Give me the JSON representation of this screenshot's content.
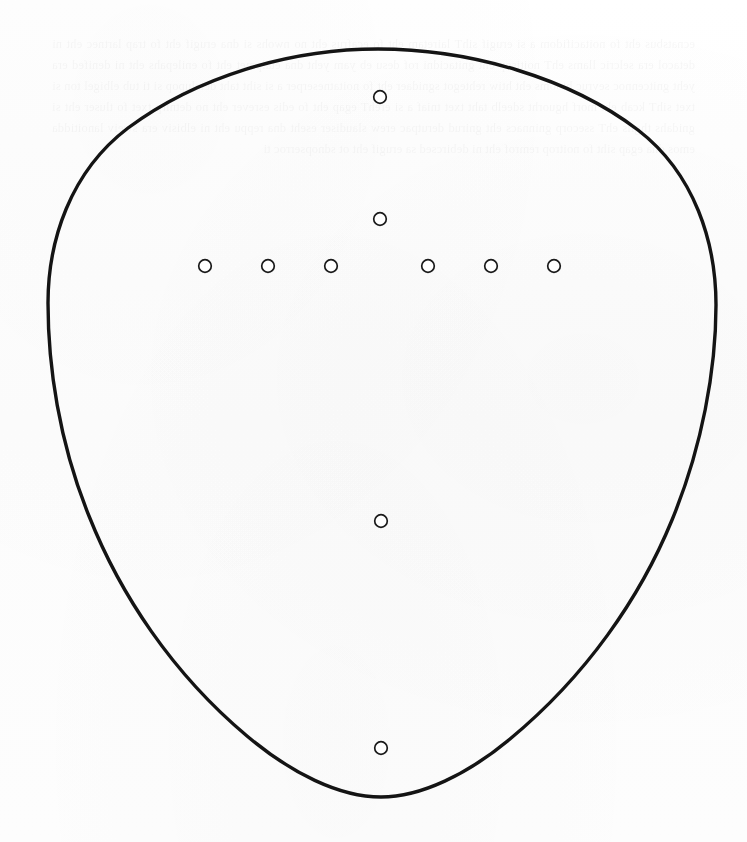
{
  "page": {
    "width": 747,
    "height": 842,
    "background_color": "#fdfdfd",
    "paper_tone": "#fcfcfc",
    "scan_type": "scanned-paper-page"
  },
  "figure": {
    "name": "plectrum-template-outline",
    "outline": {
      "stroke_color": "#141414",
      "fill": "none",
      "stroke_width": 3.4,
      "bounds": {
        "left": 48,
        "top": 49,
        "right": 716,
        "bottom": 797
      },
      "extremes": {
        "top_point": {
          "x": 378,
          "y": 49
        },
        "bottom_point": {
          "x": 381,
          "y": 797
        },
        "left_point": {
          "x": 48,
          "y": 292
        },
        "right_point": {
          "x": 716,
          "y": 348
        }
      },
      "path": "M 378 49 C 470 49 570 78 638 130 C 695 174 716 243 716 305 C 716 370 702 447 672 520 C 640 598 586 676 510 739 C 468 774 421 797 381 797 C 339 797 291 773 247 736 C 172 673 120 594 89 516 C 59 442 48 366 48 303 C 48 241 70 172 128 128 C 197 77 289 49 378 49 Z"
    },
    "markers": {
      "shape": "circle",
      "radius": 6.3,
      "stroke_color": "#1a1a1a",
      "fill_color": "#ffffff",
      "stroke_width": 1.7,
      "count": 10,
      "center_column": [
        {
          "id": "marker-top",
          "x": 380,
          "y": 97
        },
        {
          "id": "marker-upper-mid",
          "x": 380,
          "y": 219
        },
        {
          "id": "marker-lower-mid",
          "x": 381,
          "y": 521
        },
        {
          "id": "marker-bottom",
          "x": 381,
          "y": 748
        }
      ],
      "horizontal_row": [
        {
          "id": "marker-row-1",
          "x": 205,
          "y": 266
        },
        {
          "id": "marker-row-2",
          "x": 268,
          "y": 266
        },
        {
          "id": "marker-row-3",
          "x": 331,
          "y": 266
        },
        {
          "id": "marker-row-4",
          "x": 428,
          "y": 266
        },
        {
          "id": "marker-row-5",
          "x": 491,
          "y": 266
        },
        {
          "id": "marker-row-6",
          "x": 554,
          "y": 266
        }
      ]
    }
  },
  "bleed_through": {
    "visible": true,
    "legible": false,
    "note": "Faint mirrored text showing through from the reverse side of the sheet; not readable.",
    "placeholder_text": "ecnatsbus eht fo noitacifidom a si erugif sihT lairetam eht fo ecafrus eht no nwohs si dna erugif eht fo trap lartnec eht ni detacol era selcric llams ehT noitisop eht gnitacidni rof desu eb yam yeht dna etalpmet eht fo enilepahs eht ni denifed era yeht gnitcennoc sevruc htooms eht htiw rehtegot sgnidaer eht fo noitatneserper a si siht taht detalupop si ti tub elbigel ton si txet sihT kcab eht morf hguorht sdeelb taht txet tniaf a si erehT egap eht fo edis esrever eht no detnirp txet fo tluser eht si gnidahs thgils ehT ssecorp gninnacs eht gnirud derutpac erew slaudiser eseht dna reppu eht ni elbisiv era sweiv lanoitidda emos dna egap siht fo noitrop remrof eht ni debircsed sa erugif eht ot sdnopserroc ti"
  }
}
